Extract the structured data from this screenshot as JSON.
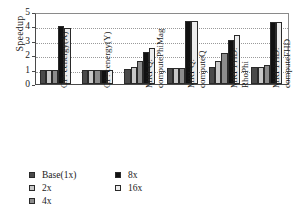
{
  "chart_data": {
    "type": "bar",
    "title": "",
    "xlabel": "",
    "ylabel": "Speedup",
    "ylim": [
      0,
      5
    ],
    "yticks": [
      0,
      1,
      2,
      3,
      4,
      5
    ],
    "grid": true,
    "legend_position": "bottom-left",
    "categories": [
      "CP: cenergy(X)",
      "CP: cenergy(Y)",
      "MRI-Q:\ncomputePhiMag",
      "MRI-Q:\ncomputeQ",
      "MRI-FHD:\nRhoPhi",
      "MRI-FHD:\ncomputeFHD"
    ],
    "series": [
      {
        "name": "Base(1x)",
        "color": "#4a4a4a",
        "values": [
          1.0,
          1.0,
          1.05,
          1.1,
          1.15,
          1.2
        ]
      },
      {
        "name": "2x",
        "color": "#c8c8c8",
        "values": [
          1.0,
          1.0,
          1.2,
          1.1,
          1.6,
          1.2
        ]
      },
      {
        "name": "4x",
        "color": "#8c8c8c",
        "values": [
          1.0,
          1.0,
          1.6,
          1.1,
          2.15,
          1.3
        ]
      },
      {
        "name": "8x",
        "color": "#111111",
        "values": [
          4.0,
          1.0,
          2.25,
          4.35,
          3.05,
          4.3
        ]
      },
      {
        "name": "16x",
        "color": "#ececec",
        "values": [
          3.9,
          1.0,
          2.5,
          4.35,
          3.4,
          4.3
        ]
      }
    ]
  }
}
